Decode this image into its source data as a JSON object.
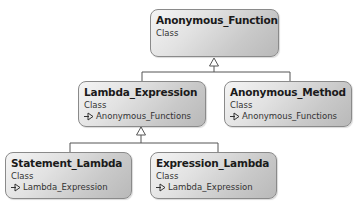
{
  "diagram": {
    "type": "UML class hierarchy",
    "classes": [
      {
        "id": "anonymous_function",
        "name": "Anonymous_Function",
        "kind": "Class",
        "parent": null
      },
      {
        "id": "lambda_expression",
        "name": "Lambda_Expression",
        "kind": "Class",
        "parent": "Anonymous_Functions"
      },
      {
        "id": "anonymous_method",
        "name": "Anonymous_Method",
        "kind": "Class",
        "parent": "Anonymous_Functions"
      },
      {
        "id": "statement_lambda",
        "name": "Statement_Lambda",
        "kind": "Class",
        "parent": "Lambda_Expression"
      },
      {
        "id": "expression_lambda",
        "name": "Expression_Lambda",
        "kind": "Class",
        "parent": "Lambda_Expression"
      }
    ],
    "edges": [
      {
        "from": "Lambda_Expression",
        "to": "Anonymous_Function",
        "type": "inheritance"
      },
      {
        "from": "Anonymous_Method",
        "to": "Anonymous_Function",
        "type": "inheritance"
      },
      {
        "from": "Statement_Lambda",
        "to": "Lambda_Expression",
        "type": "inheritance"
      },
      {
        "from": "Expression_Lambda",
        "to": "Lambda_Expression",
        "type": "inheritance"
      }
    ],
    "colors": {
      "box_border": "#8a8a8a",
      "box_fill_light": "#f4f4f4",
      "box_fill_dark": "#b9b9b9",
      "line": "#555555",
      "text": "#1a1a1a"
    }
  }
}
